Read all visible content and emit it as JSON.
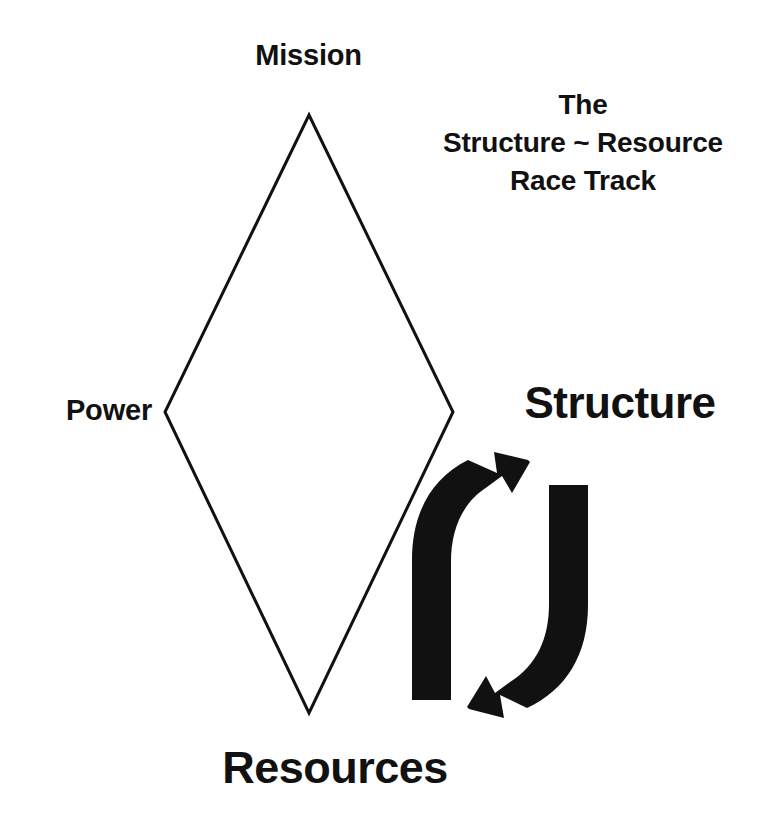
{
  "figure": {
    "title_lines": [
      "The",
      "Structure ~ Resource",
      "Race Track"
    ],
    "background_color": "#ffffff",
    "ink_color": "#111111"
  },
  "diamond": {
    "label": "diamond-outline",
    "vertices": {
      "top": {
        "label": "Mission",
        "x": 309,
        "y": 115
      },
      "left": {
        "label": "Power",
        "x": 165,
        "y": 412
      },
      "right": {
        "label": "",
        "x": 453,
        "y": 412
      },
      "bottom": {
        "label": "Resources",
        "x": 309,
        "y": 713
      }
    },
    "stroke_color": "#111111",
    "stroke_width": 3,
    "fill": "none"
  },
  "labels": {
    "mission": "Mission",
    "power": "Power",
    "structure": "Structure",
    "resources": "Resources"
  },
  "cycle_arrows": {
    "name": "structure-resource-cycle",
    "color": "#111111",
    "left_arrow": {
      "name": "upward-arrow",
      "direction": "up-right",
      "from": "Resources",
      "to": "Structure"
    },
    "right_arrow": {
      "name": "downward-arrow",
      "direction": "down-left",
      "from": "Structure",
      "to": "Resources"
    }
  }
}
